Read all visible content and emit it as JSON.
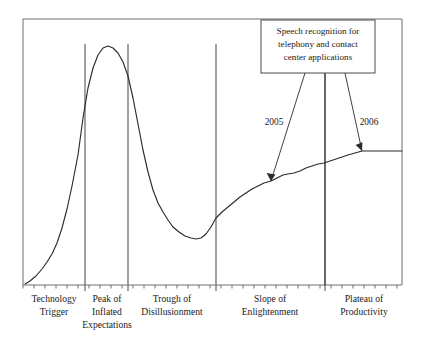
{
  "figure": {
    "background_color": "#ffffff",
    "curve_color": "#2b2b2b",
    "divider_color": "#8a8a8a",
    "axis_color": "#6f6f6f"
  },
  "callout": {
    "lines": [
      "Speech recognition for",
      "telephony and contact",
      "center applications"
    ],
    "border_color": "#4a4a4a",
    "fill_color": "#ffffff"
  },
  "annotations": [
    {
      "label": "2005",
      "target_x": 271,
      "target_y": 181
    },
    {
      "label": "2006",
      "target_x": 362,
      "target_y": 151
    }
  ],
  "phases": [
    {
      "id": "technology-trigger",
      "lines": [
        "Technology",
        "Trigger"
      ],
      "center_x": 54
    },
    {
      "id": "peak-of-inflated-expectations",
      "lines": [
        "Peak of",
        "Inflated",
        "Expectations"
      ],
      "center_x": 107
    },
    {
      "id": "trough-of-disillusionment",
      "lines": [
        "Trough of",
        "Disillusionment"
      ],
      "center_x": 172
    },
    {
      "id": "slope-of-enlightenment",
      "lines": [
        "Slope of",
        "Enlightenment"
      ],
      "center_x": 270
    },
    {
      "id": "plateau-of-productivity",
      "lines": [
        "Plateau of",
        "Productivity"
      ],
      "center_x": 364
    }
  ],
  "chart_data": {
    "type": "line",
    "xlabel": "",
    "ylabel": "",
    "grid": false,
    "legend": "none",
    "xlim": [
      23,
      402
    ],
    "ylim": [
      285,
      19
    ],
    "axis_frame": {
      "left": 23,
      "top": 19,
      "right": 402,
      "bottom": 285
    },
    "phase_boundaries_x": [
      85,
      128,
      216,
      325
    ],
    "tick_spacing_px": 11,
    "series": [
      {
        "name": "Visibility / Expectations",
        "points": [
          [
            25,
            284
          ],
          [
            30,
            281
          ],
          [
            36,
            276
          ],
          [
            42,
            269
          ],
          [
            47,
            262
          ],
          [
            52,
            254
          ],
          [
            57,
            243
          ],
          [
            62,
            228
          ],
          [
            67,
            209
          ],
          [
            72,
            186
          ],
          [
            78,
            155
          ],
          [
            83,
            118
          ],
          [
            88,
            88
          ],
          [
            93,
            68
          ],
          [
            98,
            55
          ],
          [
            103,
            48
          ],
          [
            108,
            46
          ],
          [
            113,
            48
          ],
          [
            118,
            53
          ],
          [
            123,
            62
          ],
          [
            128,
            76
          ],
          [
            133,
            98
          ],
          [
            138,
            124
          ],
          [
            143,
            150
          ],
          [
            148,
            172
          ],
          [
            153,
            190
          ],
          [
            158,
            203
          ],
          [
            163,
            212
          ],
          [
            168,
            220
          ],
          [
            173,
            227
          ],
          [
            179,
            232
          ],
          [
            185,
            236
          ],
          [
            191,
            238
          ],
          [
            196,
            239
          ],
          [
            201,
            238
          ],
          [
            206,
            234
          ],
          [
            211,
            227
          ],
          [
            216,
            218
          ],
          [
            222,
            212
          ],
          [
            228,
            207
          ],
          [
            234,
            202
          ],
          [
            240,
            197
          ],
          [
            246,
            193
          ],
          [
            252,
            189
          ],
          [
            258,
            186
          ],
          [
            264,
            183
          ],
          [
            271,
            181
          ],
          [
            277,
            178
          ],
          [
            283,
            175
          ],
          [
            288,
            174
          ],
          [
            294,
            173
          ],
          [
            300,
            171
          ],
          [
            306,
            168
          ],
          [
            312,
            166
          ],
          [
            318,
            164
          ],
          [
            324,
            163
          ],
          [
            330,
            161
          ],
          [
            336,
            159
          ],
          [
            342,
            157
          ],
          [
            348,
            155
          ],
          [
            355,
            153
          ],
          [
            362,
            151
          ],
          [
            370,
            151
          ],
          [
            380,
            151
          ],
          [
            390,
            151
          ],
          [
            402,
            151
          ]
        ]
      }
    ]
  }
}
